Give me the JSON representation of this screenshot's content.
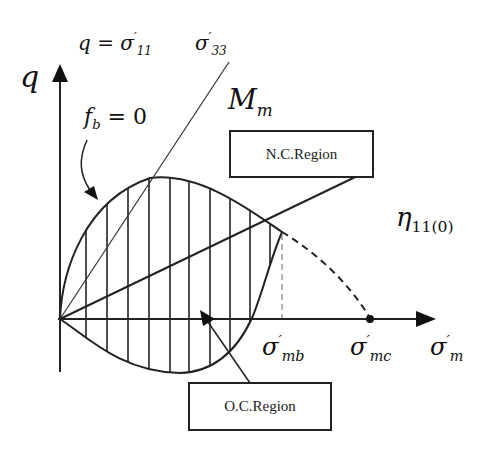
{
  "diagram": {
    "axes": {
      "y_label": "q",
      "x_label_base": "σ",
      "x_label_sup": "′",
      "x_label_sub": "m"
    },
    "labels": {
      "q_eq_base": "q = σ",
      "q_eq_sup": "′",
      "q_eq_sub": "11",
      "sigma33_base": "σ",
      "sigma33_sup": "′",
      "sigma33_sub": "33",
      "fb_base": "f",
      "fb_sub": "b",
      "fb_rest": " = 0",
      "Mm_base": "M",
      "Mm_sub": "m",
      "eta_base": "η",
      "eta_sub": "11(0)",
      "sigma_mb_base": "σ",
      "sigma_mb_sup": "′",
      "sigma_mb_sub": "mb",
      "sigma_mc_base": "σ",
      "sigma_mc_sup": "′",
      "sigma_mc_sub": "mc"
    },
    "regions": {
      "nc": "N.C.Region",
      "oc": "O.C.Region"
    },
    "colors": {
      "ink": "#222222",
      "background": "#ffffff"
    }
  }
}
